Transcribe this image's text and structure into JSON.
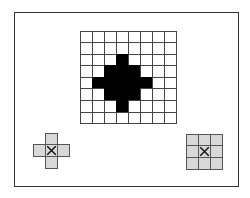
{
  "diagram": {
    "frame": {
      "border_color": "#333333"
    },
    "main_grid": {
      "rows": 8,
      "cols": 8,
      "filled_color": "#000000",
      "empty_color": "#ffffff",
      "pattern": [
        [
          0,
          0,
          0,
          0,
          0,
          0,
          0,
          0
        ],
        [
          0,
          0,
          0,
          0,
          0,
          0,
          0,
          0
        ],
        [
          0,
          0,
          0,
          1,
          0,
          0,
          0,
          0
        ],
        [
          0,
          0,
          1,
          1,
          1,
          0,
          0,
          0
        ],
        [
          0,
          1,
          1,
          1,
          1,
          1,
          0,
          0
        ],
        [
          0,
          0,
          1,
          1,
          1,
          0,
          0,
          0
        ],
        [
          0,
          0,
          0,
          1,
          0,
          0,
          0,
          0
        ],
        [
          0,
          0,
          0,
          0,
          0,
          0,
          0,
          0
        ]
      ]
    },
    "structuring_elements": [
      {
        "name": "cross-element",
        "rows": 3,
        "cols": 3,
        "color": "#d8d8d8",
        "pattern": [
          [
            0,
            1,
            0
          ],
          [
            1,
            2,
            1
          ],
          [
            0,
            1,
            0
          ]
        ]
      },
      {
        "name": "square-element",
        "rows": 3,
        "cols": 3,
        "color": "#d8d8d8",
        "pattern": [
          [
            1,
            1,
            1
          ],
          [
            1,
            2,
            1
          ],
          [
            1,
            1,
            1
          ]
        ]
      }
    ]
  }
}
